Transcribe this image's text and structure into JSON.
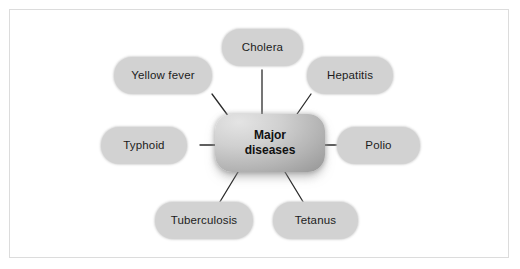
{
  "diagram": {
    "type": "mind-map",
    "title": "Major diseases",
    "center": {
      "label_line1": "Major",
      "label_line2": "diseases",
      "fill_light": "#e4e4e4",
      "fill_dark": "#8e8e8e"
    },
    "node_fill": "#d2d2d2",
    "link_color": "#2b2b2b",
    "frame_color": "#dcdcdc",
    "background": "#ffffff",
    "nodes": [
      {
        "id": "cholera",
        "label": "Cholera"
      },
      {
        "id": "hepatitis",
        "label": "Hepatitis"
      },
      {
        "id": "polio",
        "label": "Polio"
      },
      {
        "id": "tetanus",
        "label": "Tetanus"
      },
      {
        "id": "tuberculosis",
        "label": "Tuberculosis"
      },
      {
        "id": "typhoid",
        "label": "Typhoid"
      },
      {
        "id": "yellow-fever",
        "label": "Yellow fever"
      }
    ]
  }
}
